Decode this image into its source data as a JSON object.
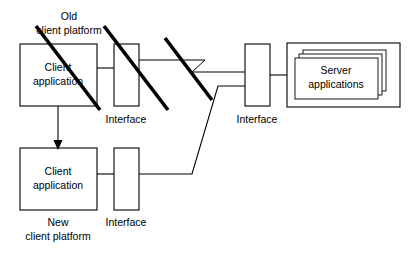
{
  "diagram": {
    "nodes": {
      "old_platform_label": "Old\nclient platform",
      "old_platform_label_line1": "Old",
      "old_platform_label_line2": "client platform",
      "old_client_app_line1": "Client",
      "old_client_app_line2": "application",
      "old_interface_label": "Interface",
      "new_platform_label_line1": "New",
      "new_platform_label_line2": "client platform",
      "new_client_app_line1": "Client",
      "new_client_app_line2": "application",
      "new_interface_label": "Interface",
      "server_interface_label": "Interface",
      "server_apps_line1": "Server",
      "server_apps_line2": "applications"
    },
    "colors": {
      "stroke": "#000000",
      "background": "#ffffff",
      "text": "#000000"
    },
    "annotations": {
      "strike_count": 3,
      "migration_arrow": "downward arrow from old client application to new client application",
      "break_symbol": "zigzag line break on old platform connection"
    }
  }
}
